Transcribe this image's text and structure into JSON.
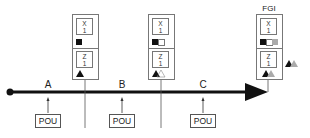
{
  "diagram": {
    "type": "process-flow",
    "timeline": {
      "start_marker": "filled-circle",
      "end_marker": "arrowhead",
      "segments": [
        {
          "label": "A",
          "input": "POU"
        },
        {
          "label": "B",
          "input": "POU"
        },
        {
          "label": "C",
          "input": "POU"
        }
      ]
    },
    "stations": [
      {
        "id": "station-1",
        "title": "",
        "top_cell": {
          "line1": "X",
          "line2": "1"
        },
        "indicator": "filled-square",
        "bottom_cell": {
          "line1": "Z",
          "line2": "1"
        },
        "bottom_indicator": "filled-triangle"
      },
      {
        "id": "station-2",
        "title": "",
        "top_cell": {
          "line1": "X",
          "line2": "1"
        },
        "indicator": "filled-square + empty-square",
        "bottom_cell": {
          "line1": "Z",
          "line2": "1"
        },
        "bottom_indicator": "filled-triangle + empty-triangle"
      },
      {
        "id": "station-3",
        "title": "FGI",
        "top_cell": {
          "line1": "X",
          "line2": "1"
        },
        "indicator": "filled-square + empty-square + gray-square",
        "bottom_cell": {
          "line1": "Z",
          "line2": "1"
        },
        "bottom_indicator": "filled-triangle + gray-triangle"
      }
    ],
    "output_symbol": "filled-triangle + gray-triangle",
    "colors": {
      "line": "#111111",
      "box_border": "#777777",
      "filled": "#111111",
      "gray": "#aaaaaa"
    }
  }
}
